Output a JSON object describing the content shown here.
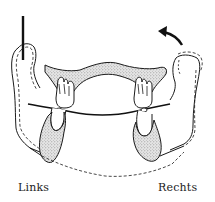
{
  "figure": {
    "type": "mandible-diagram",
    "labels": {
      "left": "Links",
      "right": "Rechts"
    },
    "elements": {
      "vertical_bar": "reference-bar",
      "arrow": "rotation-arrow-counterclockwise",
      "occlusal_line": "occlusal-plane-line"
    },
    "colors": {
      "stroke": "#1a1a1a",
      "stipple_fill": "#d4d4d4",
      "background": "#ffffff"
    }
  }
}
